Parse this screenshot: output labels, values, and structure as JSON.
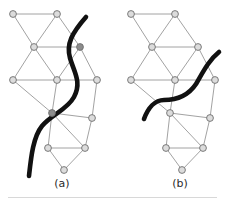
{
  "figure": {
    "title": "",
    "background": "#ffffff",
    "width": 225,
    "height": 202,
    "node_style": {
      "radius": 3.4,
      "fill_light": "#dcdcdc",
      "fill_dark": "#8c8c8c",
      "stroke": "#6e6e6e",
      "stroke_width": 0.9
    },
    "edge_style": {
      "stroke": "#8a8a8a",
      "stroke_width": 0.8
    },
    "curve_style": {
      "stroke": "#111111",
      "stroke_width": 4.6,
      "fill": "none",
      "linecap": "round"
    }
  },
  "panels": [
    {
      "id": "a",
      "caption": "(a)",
      "caption_x": 62,
      "caption_y": 184,
      "nodes": [
        {
          "id": "a0",
          "x": 13,
          "y": 14,
          "shade": "light"
        },
        {
          "id": "a1",
          "x": 57,
          "y": 14,
          "shade": "light"
        },
        {
          "id": "a2",
          "x": 34,
          "y": 47,
          "shade": "light"
        },
        {
          "id": "a3",
          "x": 80,
          "y": 47,
          "shade": "dark"
        },
        {
          "id": "a4",
          "x": 13,
          "y": 80,
          "shade": "light"
        },
        {
          "id": "a5",
          "x": 57,
          "y": 80,
          "shade": "light"
        },
        {
          "id": "a6",
          "x": 97,
          "y": 80,
          "shade": "light"
        },
        {
          "id": "a7",
          "x": 52,
          "y": 113,
          "shade": "dark"
        },
        {
          "id": "a8",
          "x": 92,
          "y": 118,
          "shade": "light"
        },
        {
          "id": "a9",
          "x": 48,
          "y": 148,
          "shade": "light"
        },
        {
          "id": "a10",
          "x": 85,
          "y": 148,
          "shade": "light"
        },
        {
          "id": "a11",
          "x": 64,
          "y": 170,
          "shade": "light"
        }
      ],
      "edges": [
        [
          "a0",
          "a1"
        ],
        [
          "a0",
          "a2"
        ],
        [
          "a1",
          "a2"
        ],
        [
          "a1",
          "a3"
        ],
        [
          "a2",
          "a3"
        ],
        [
          "a2",
          "a4"
        ],
        [
          "a2",
          "a5"
        ],
        [
          "a4",
          "a5"
        ],
        [
          "a5",
          "a3"
        ],
        [
          "a3",
          "a6"
        ],
        [
          "a5",
          "a6"
        ],
        [
          "a4",
          "a7"
        ],
        [
          "a5",
          "a7"
        ],
        [
          "a6",
          "a8"
        ],
        [
          "a7",
          "a8"
        ],
        [
          "a7",
          "a9"
        ],
        [
          "a7",
          "a10"
        ],
        [
          "a9",
          "a10"
        ],
        [
          "a8",
          "a10"
        ],
        [
          "a9",
          "a11"
        ],
        [
          "a10",
          "a11"
        ]
      ],
      "curve": "M 86 17 C 72 33, 66 44, 70 58 C 74 72, 82 82, 74 97 C 67 110, 52 114, 42 126 C 33 137, 31 158, 29 176"
    },
    {
      "id": "b",
      "caption": "(b)",
      "caption_x": 180,
      "caption_y": 184,
      "nodes": [
        {
          "id": "b0",
          "x": 131,
          "y": 14,
          "shade": "light"
        },
        {
          "id": "b1",
          "x": 175,
          "y": 14,
          "shade": "light"
        },
        {
          "id": "b2",
          "x": 152,
          "y": 47,
          "shade": "light"
        },
        {
          "id": "b3",
          "x": 198,
          "y": 47,
          "shade": "light"
        },
        {
          "id": "b4",
          "x": 131,
          "y": 80,
          "shade": "light"
        },
        {
          "id": "b5",
          "x": 175,
          "y": 80,
          "shade": "light"
        },
        {
          "id": "b6",
          "x": 215,
          "y": 80,
          "shade": "light"
        },
        {
          "id": "b7",
          "x": 170,
          "y": 113,
          "shade": "light"
        },
        {
          "id": "b8",
          "x": 210,
          "y": 118,
          "shade": "light"
        },
        {
          "id": "b9",
          "x": 166,
          "y": 148,
          "shade": "light"
        },
        {
          "id": "b10",
          "x": 203,
          "y": 148,
          "shade": "light"
        },
        {
          "id": "b11",
          "x": 182,
          "y": 170,
          "shade": "light"
        }
      ],
      "edges": [
        [
          "b0",
          "b1"
        ],
        [
          "b0",
          "b2"
        ],
        [
          "b1",
          "b2"
        ],
        [
          "b1",
          "b3"
        ],
        [
          "b2",
          "b3"
        ],
        [
          "b2",
          "b4"
        ],
        [
          "b2",
          "b5"
        ],
        [
          "b4",
          "b5"
        ],
        [
          "b5",
          "b3"
        ],
        [
          "b3",
          "b6"
        ],
        [
          "b5",
          "b6"
        ],
        [
          "b4",
          "b7"
        ],
        [
          "b5",
          "b7"
        ],
        [
          "b6",
          "b8"
        ],
        [
          "b7",
          "b8"
        ],
        [
          "b7",
          "b9"
        ],
        [
          "b7",
          "b10"
        ],
        [
          "b9",
          "b10"
        ],
        [
          "b8",
          "b10"
        ],
        [
          "b9",
          "b11"
        ],
        [
          "b10",
          "b11"
        ]
      ],
      "curve": "M 219 52 C 209 60, 203 72, 196 84 C 188 96, 176 100, 164 100 C 155 100, 148 108, 144 119"
    }
  ]
}
